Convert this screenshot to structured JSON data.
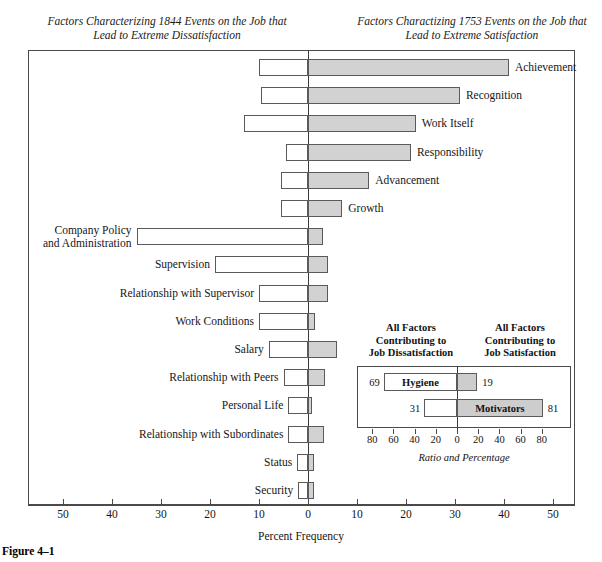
{
  "figure": {
    "caption": "Figure 4–1",
    "heading_left": "Factors Characterizing 1844 Events on the\nJob that Lead to Extreme Dissatisfaction",
    "heading_right": "Factors Charactizing 1753 Events on the\nJob that Lead to Extreme Satisfaction",
    "axis_title": "Percent Frequency"
  },
  "chart_data": {
    "type": "bar",
    "xlabel": "Percent Frequency",
    "ylabel": "",
    "orientation": "horizontal-diverging",
    "grid": false,
    "legend_position": "none",
    "xlim": [
      -50,
      50
    ],
    "xticks": [
      50,
      40,
      30,
      20,
      10,
      0,
      10,
      20,
      30,
      40,
      50
    ],
    "xtick_signed": [
      -50,
      -40,
      -30,
      -20,
      -10,
      0,
      10,
      20,
      30,
      40,
      50
    ],
    "series": [
      {
        "name": "Dissatisfaction (left, white)",
        "color": "#ffffff"
      },
      {
        "name": "Satisfaction (right, shaded)",
        "color": "#d2d2d2"
      }
    ],
    "categories": [
      "Achievement",
      "Recognition",
      "Work Itself",
      "Responsibility",
      "Advancement",
      "Growth",
      "Company Policy\nand Administration",
      "Supervision",
      "Relationship with Supervisor",
      "Work Conditions",
      "Salary",
      "Relationship with Peers",
      "Personal Life",
      "Relationship with Subordinates",
      "Status",
      "Security"
    ],
    "bars": [
      {
        "label": "Achievement",
        "label_side": "right",
        "dissatisfaction": 10.0,
        "satisfaction": 41.0
      },
      {
        "label": "Recognition",
        "label_side": "right",
        "dissatisfaction": 9.5,
        "satisfaction": 31.0
      },
      {
        "label": "Work Itself",
        "label_side": "right",
        "dissatisfaction": 13.0,
        "satisfaction": 22.0
      },
      {
        "label": "Responsibility",
        "label_side": "right",
        "dissatisfaction": 4.5,
        "satisfaction": 21.0
      },
      {
        "label": "Advancement",
        "label_side": "right",
        "dissatisfaction": 5.5,
        "satisfaction": 12.5
      },
      {
        "label": "Growth",
        "label_side": "right",
        "dissatisfaction": 5.5,
        "satisfaction": 7.0
      },
      {
        "label": "Company Policy\nand Administration",
        "label_side": "left",
        "dissatisfaction": 35.0,
        "satisfaction": 3.0
      },
      {
        "label": "Supervision",
        "label_side": "left",
        "dissatisfaction": 19.0,
        "satisfaction": 4.0
      },
      {
        "label": "Relationship with Supervisor",
        "label_side": "left",
        "dissatisfaction": 10.0,
        "satisfaction": 4.0
      },
      {
        "label": "Work Conditions",
        "label_side": "left",
        "dissatisfaction": 10.0,
        "satisfaction": 1.5
      },
      {
        "label": "Salary",
        "label_side": "left",
        "dissatisfaction": 8.0,
        "satisfaction": 6.0
      },
      {
        "label": "Relationship with Peers",
        "label_side": "left",
        "dissatisfaction": 5.0,
        "satisfaction": 3.5
      },
      {
        "label": "Personal Life",
        "label_side": "left",
        "dissatisfaction": 4.0,
        "satisfaction": 0.8
      },
      {
        "label": "Relationship with Subordinates",
        "label_side": "left",
        "dissatisfaction": 4.0,
        "satisfaction": 3.2
      },
      {
        "label": "Status",
        "label_side": "left",
        "dissatisfaction": 2.2,
        "satisfaction": 1.2
      },
      {
        "label": "Security",
        "label_side": "left",
        "dissatisfaction": 2.0,
        "satisfaction": 1.2
      }
    ]
  },
  "inset": {
    "heading_left": "All Factors\nContributing to\nJob Dissatisfaction",
    "heading_right": "All Factors\nContributing to\nJob Satisfaction",
    "axis_title": "Ratio and Percentage",
    "xticks": [
      80,
      60,
      40,
      20,
      0,
      20,
      40,
      60,
      80
    ],
    "xlim": [
      -90,
      90
    ],
    "rows": [
      {
        "name": "Hygiene",
        "left_value": "69",
        "right_value": "19",
        "left_pct": 69,
        "right_pct": 19
      },
      {
        "name": "Motivators",
        "left_value": "31",
        "right_value": "81",
        "left_pct": 31,
        "right_pct": 81
      }
    ],
    "chart_data": {
      "type": "bar",
      "orientation": "horizontal-diverging",
      "categories": [
        "Hygiene",
        "Motivators"
      ],
      "series": [
        {
          "name": "Contributing to Job Dissatisfaction",
          "values": [
            69,
            31
          ]
        },
        {
          "name": "Contributing to Job Satisfaction",
          "values": [
            19,
            81
          ]
        }
      ],
      "xlabel": "Ratio and Percentage",
      "xticks": [
        80,
        60,
        40,
        20,
        0,
        20,
        40,
        60,
        80
      ]
    }
  },
  "colors": {
    "bar_positive": "#d2d2d2",
    "bar_negative": "#ffffff",
    "frame": "#4a4a4a",
    "text": "#161616"
  }
}
